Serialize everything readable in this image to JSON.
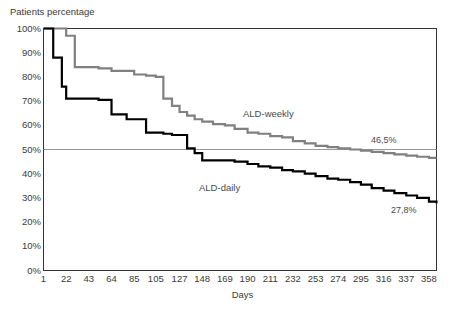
{
  "chart_data": {
    "type": "line",
    "title": "",
    "ylabel": "Patients percentage",
    "xlabel": "Days",
    "ylim": [
      0,
      100
    ],
    "xlim": [
      1,
      365
    ],
    "grid": "single horizontal reference line at 50%",
    "legend_position": "inline annotations on curves",
    "y_ticks": [
      "0%",
      "10%",
      "20%",
      "30%",
      "40%",
      "50%",
      "60%",
      "70%",
      "80%",
      "90%",
      "100%"
    ],
    "y_tick_values": [
      0,
      10,
      20,
      30,
      40,
      50,
      60,
      70,
      80,
      90,
      100
    ],
    "x_ticks": [
      "1",
      "22",
      "43",
      "64",
      "85",
      "105",
      "127",
      "148",
      "169",
      "190",
      "211",
      "232",
      "253",
      "274",
      "295",
      "316",
      "337",
      "358"
    ],
    "x_tick_values": [
      1,
      22,
      43,
      64,
      85,
      105,
      127,
      148,
      169,
      190,
      211,
      232,
      253,
      274,
      295,
      316,
      337,
      358
    ],
    "reference_line": {
      "value": 50,
      "label": "50%"
    },
    "series": [
      {
        "name": "ALD-weekly",
        "color": "#808080",
        "style": "step",
        "endpoint_label": "46,5%",
        "endpoint_value": 46.5,
        "x": [
          1,
          14,
          22,
          30,
          43,
          52,
          64,
          78,
          85,
          96,
          105,
          112,
          120,
          127,
          134,
          141,
          148,
          158,
          169,
          178,
          190,
          200,
          211,
          222,
          232,
          243,
          253,
          264,
          274,
          285,
          295,
          305,
          316,
          326,
          337,
          347,
          358,
          365
        ],
        "values": [
          100,
          100,
          97,
          84,
          84,
          83.5,
          82.5,
          82.5,
          81,
          80.5,
          80,
          71,
          68,
          65.5,
          64,
          62.5,
          61.5,
          60.5,
          60,
          58.5,
          57,
          56.5,
          55.5,
          55,
          53.5,
          52.5,
          51.5,
          51,
          50.5,
          50,
          49.5,
          49,
          48.5,
          48,
          47.5,
          47,
          46.5,
          46.5
        ]
      },
      {
        "name": "ALD-daily",
        "color": "#000000",
        "style": "step",
        "endpoint_label": "27,8%",
        "endpoint_value": 27.8,
        "x": [
          1,
          10,
          18,
          22,
          30,
          43,
          52,
          64,
          72,
          78,
          85,
          96,
          105,
          112,
          120,
          127,
          134,
          141,
          148,
          158,
          169,
          178,
          190,
          200,
          211,
          222,
          232,
          243,
          253,
          264,
          274,
          285,
          295,
          305,
          316,
          326,
          337,
          347,
          358,
          365
        ],
        "values": [
          100,
          88,
          76,
          71,
          71,
          71,
          70.5,
          64.5,
          64.5,
          62.5,
          62.5,
          57,
          57,
          56.5,
          56,
          56,
          50.5,
          48.5,
          45.5,
          45.5,
          45.5,
          45,
          44,
          43,
          42.5,
          41.5,
          41,
          40,
          39,
          38,
          37.5,
          36.5,
          35.5,
          34,
          33,
          32,
          31,
          30,
          28.5,
          27.8
        ]
      }
    ]
  },
  "annotations": {
    "weekly_label": "ALD-weekly",
    "daily_label": "ALD-daily",
    "weekly_end": "46,5%",
    "daily_end": "27,8%"
  },
  "caption_fragment": {
    "text": ""
  }
}
